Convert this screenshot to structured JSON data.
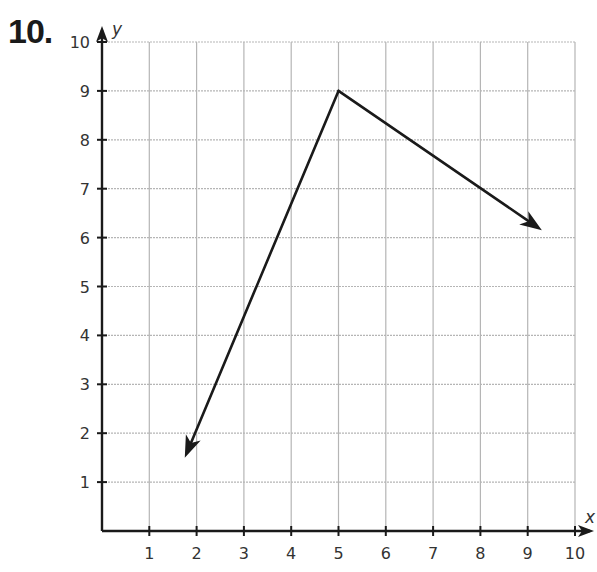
{
  "problem": {
    "number": "10."
  },
  "chart_data": {
    "type": "line",
    "title": "",
    "xlabel": "x",
    "ylabel": "y",
    "xlim": [
      0,
      10
    ],
    "ylim": [
      0,
      10
    ],
    "grid": true,
    "x_ticks": [
      "1",
      "2",
      "3",
      "4",
      "5",
      "6",
      "7",
      "8",
      "9",
      "10"
    ],
    "y_ticks": [
      "1",
      "2",
      "3",
      "4",
      "5",
      "6",
      "7",
      "8",
      "9",
      "10"
    ],
    "series": [
      {
        "name": "angle-rays",
        "description": "Two rays from a common vertex at (5, 9), each ending in an arrowhead",
        "vertex": [
          5,
          9
        ],
        "rays": [
          {
            "end": [
              1.75,
              1.5
            ],
            "arrow": true
          },
          {
            "end": [
              9.3,
              6.15
            ],
            "arrow": true
          }
        ]
      }
    ],
    "colors": {
      "grid": "#b5b5b5",
      "axis": "#1a1a1a",
      "rays": "#1a1a1a",
      "text": "#333333"
    }
  }
}
